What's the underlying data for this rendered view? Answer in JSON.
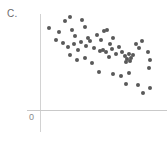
{
  "figure": {
    "panel_label": "C.",
    "origin_label": "0",
    "point_color": "#595959",
    "axis_color": "#d2d2d2",
    "background_color": "#ffffff"
  },
  "chart_data": {
    "type": "scatter",
    "title": "C.",
    "xlabel": "",
    "ylabel": "",
    "subtitle": "",
    "annotations": [
      "0"
    ],
    "grid": false,
    "legend": null,
    "axis_origin_label": "0",
    "relationship": "negative",
    "xlim": [
      0,
      10
    ],
    "ylim": [
      0,
      10
    ],
    "n_points": 52,
    "x": [
      1.1,
      1.9,
      2.2,
      2.6,
      2.8,
      3.0,
      3.1,
      3.4,
      3.5,
      3.7,
      3.9,
      4.1,
      4.2,
      4.4,
      4.6,
      4.7,
      4.9,
      5.0,
      5.1,
      5.3,
      5.4,
      5.6,
      5.7,
      5.8,
      5.9,
      6.0,
      6.1,
      6.3,
      6.4,
      6.5,
      6.7,
      6.8,
      6.9,
      7.0,
      7.1,
      7.2,
      7.3,
      7.4,
      7.5,
      7.6,
      7.7,
      7.8,
      7.9,
      8.1,
      8.3,
      8.5,
      8.7,
      8.9,
      9.1,
      9.3,
      9.5,
      9.7
    ],
    "y": [
      8.4,
      8.0,
      7.2,
      9.3,
      8.6,
      7.0,
      6.5,
      8.9,
      7.6,
      6.1,
      8.2,
      7.4,
      5.8,
      6.9,
      8.1,
      7.0,
      5.4,
      6.6,
      7.3,
      4.7,
      6.2,
      7.5,
      5.9,
      6.8,
      5.2,
      7.1,
      6.0,
      4.9,
      6.4,
      5.5,
      6.9,
      5.8,
      6.1,
      5.3,
      5.9,
      6.2,
      5.6,
      5.4,
      5.7,
      5.1,
      5.8,
      5.5,
      6.3,
      4.2,
      5.0,
      4.4,
      3.6,
      5.2,
      3.1,
      4.0,
      2.6,
      3.4
    ]
  },
  "points": [
    {
      "x": 49,
      "y": 28
    },
    {
      "x": 59,
      "y": 32
    },
    {
      "x": 65,
      "y": 21
    },
    {
      "x": 70,
      "y": 17
    },
    {
      "x": 72,
      "y": 30
    },
    {
      "x": 75,
      "y": 36
    },
    {
      "x": 82,
      "y": 20
    },
    {
      "x": 85,
      "y": 27
    },
    {
      "x": 88,
      "y": 38
    },
    {
      "x": 56,
      "y": 40
    },
    {
      "x": 63,
      "y": 43
    },
    {
      "x": 68,
      "y": 47
    },
    {
      "x": 74,
      "y": 44
    },
    {
      "x": 78,
      "y": 50
    },
    {
      "x": 81,
      "y": 42
    },
    {
      "x": 86,
      "y": 46
    },
    {
      "x": 90,
      "y": 41
    },
    {
      "x": 94,
      "y": 48
    },
    {
      "x": 97,
      "y": 35
    },
    {
      "x": 101,
      "y": 40
    },
    {
      "x": 104,
      "y": 31
    },
    {
      "x": 107,
      "y": 30
    },
    {
      "x": 110,
      "y": 44
    },
    {
      "x": 113,
      "y": 38
    },
    {
      "x": 100,
      "y": 51
    },
    {
      "x": 103,
      "y": 50
    },
    {
      "x": 106,
      "y": 52
    },
    {
      "x": 109,
      "y": 57
    },
    {
      "x": 112,
      "y": 49
    },
    {
      "x": 116,
      "y": 54
    },
    {
      "x": 119,
      "y": 47
    },
    {
      "x": 122,
      "y": 52
    },
    {
      "x": 125,
      "y": 56
    },
    {
      "x": 127,
      "y": 59
    },
    {
      "x": 129,
      "y": 54
    },
    {
      "x": 131,
      "y": 58
    },
    {
      "x": 133,
      "y": 55
    },
    {
      "x": 130,
      "y": 61
    },
    {
      "x": 126,
      "y": 62
    },
    {
      "x": 136,
      "y": 44
    },
    {
      "x": 139,
      "y": 48
    },
    {
      "x": 142,
      "y": 41
    },
    {
      "x": 148,
      "y": 52
    },
    {
      "x": 150,
      "y": 60
    },
    {
      "x": 149,
      "y": 68
    },
    {
      "x": 70,
      "y": 55
    },
    {
      "x": 77,
      "y": 60
    },
    {
      "x": 85,
      "y": 58
    },
    {
      "x": 92,
      "y": 63
    },
    {
      "x": 99,
      "y": 72
    },
    {
      "x": 113,
      "y": 74
    },
    {
      "x": 121,
      "y": 76
    },
    {
      "x": 129,
      "y": 73
    },
    {
      "x": 126,
      "y": 84
    },
    {
      "x": 138,
      "y": 85
    },
    {
      "x": 143,
      "y": 93
    },
    {
      "x": 150,
      "y": 88
    }
  ]
}
